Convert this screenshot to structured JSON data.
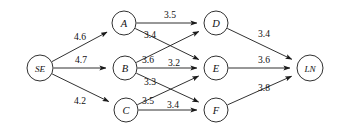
{
  "figure": {
    "kind": "directed-network-diagram",
    "background_color": "#ffffff",
    "line_color": "#1a1a1a",
    "text_color": "#111111"
  },
  "nodes": [
    {
      "id": "SE",
      "label": "SE",
      "x": 40,
      "y": 68,
      "r": 13,
      "two_char": true
    },
    {
      "id": "A",
      "label": "A",
      "x": 124,
      "y": 23,
      "r": 12,
      "two_char": false
    },
    {
      "id": "B",
      "label": "B",
      "x": 125,
      "y": 68,
      "r": 12,
      "two_char": false
    },
    {
      "id": "C",
      "label": "C",
      "x": 126,
      "y": 110,
      "r": 12,
      "two_char": false
    },
    {
      "id": "D",
      "label": "D",
      "x": 216,
      "y": 23,
      "r": 12,
      "two_char": false
    },
    {
      "id": "E",
      "label": "E",
      "x": 216,
      "y": 68,
      "r": 12,
      "two_char": false
    },
    {
      "id": "F",
      "label": "F",
      "x": 216,
      "y": 110,
      "r": 12,
      "two_char": false
    },
    {
      "id": "LN",
      "label": "LN",
      "x": 310,
      "y": 68,
      "r": 13,
      "two_char": true
    }
  ],
  "edges": [
    {
      "from": "SE",
      "to": "A",
      "weight": "4.6",
      "lx": 80,
      "ly": 36
    },
    {
      "from": "SE",
      "to": "B",
      "weight": "4.7",
      "lx": 81,
      "ly": 59
    },
    {
      "from": "SE",
      "to": "C",
      "weight": "4.2",
      "lx": 80,
      "ly": 100
    },
    {
      "from": "A",
      "to": "D",
      "weight": "3.5",
      "lx": 170,
      "ly": 14
    },
    {
      "from": "A",
      "to": "E",
      "weight": "3.4",
      "lx": 150,
      "ly": 34
    },
    {
      "from": "B",
      "to": "D",
      "weight": "3.6",
      "lx": 148,
      "ly": 59
    },
    {
      "from": "B",
      "to": "E",
      "weight": "3.2",
      "lx": 174,
      "ly": 62
    },
    {
      "from": "B",
      "to": "F",
      "weight": "3.3",
      "lx": 150,
      "ly": 81
    },
    {
      "from": "C",
      "to": "E",
      "weight": "3.5",
      "lx": 148,
      "ly": 100
    },
    {
      "from": "C",
      "to": "F",
      "weight": "3.4",
      "lx": 173,
      "ly": 104
    },
    {
      "from": "D",
      "to": "LN",
      "weight": "3.4",
      "lx": 264,
      "ly": 33
    },
    {
      "from": "E",
      "to": "LN",
      "weight": "3.6",
      "lx": 264,
      "ly": 59
    },
    {
      "from": "F",
      "to": "LN",
      "weight": "3.8",
      "lx": 264,
      "ly": 87
    }
  ]
}
